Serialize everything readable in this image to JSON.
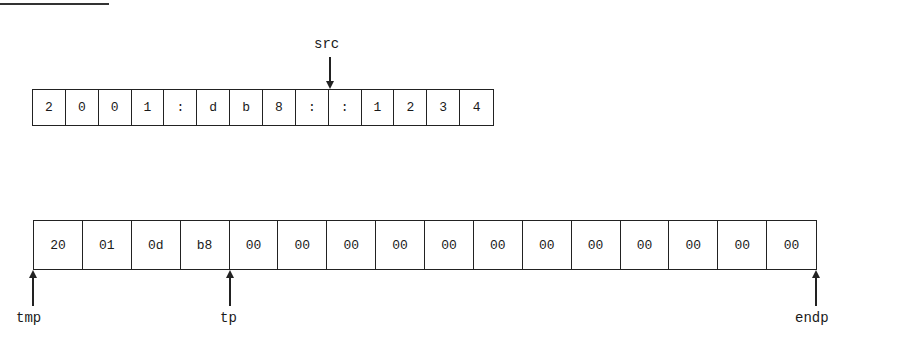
{
  "diagram": {
    "source_array": {
      "cells": [
        "2",
        "0",
        "0",
        "1",
        ":",
        "d",
        "b",
        "8",
        ":",
        ":",
        "1",
        "2",
        "3",
        "4"
      ]
    },
    "dest_array": {
      "cells": [
        "20",
        "01",
        "0d",
        "b8",
        "00",
        "00",
        "00",
        "00",
        "00",
        "00",
        "00",
        "00",
        "00",
        "00",
        "00",
        "00"
      ]
    },
    "pointers": {
      "src": "src",
      "tmp": "tmp",
      "tp": "tp",
      "endp": "endp"
    }
  }
}
